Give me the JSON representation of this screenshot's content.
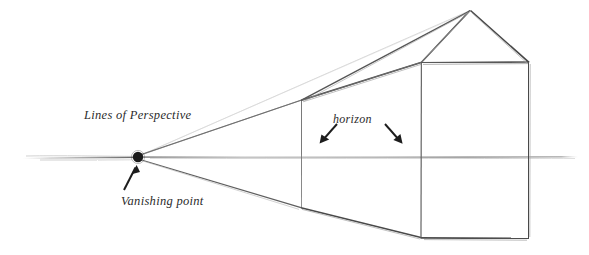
{
  "figure": {
    "medium": "pencil sketch",
    "background_color": "#ffffff",
    "ink_color": "#3a3a3a",
    "faint_ink_color": "#b9b9b9",
    "width": 589,
    "height": 255
  },
  "labels": {
    "lines_of_perspective": "Lines of Perspective",
    "vanishing_point": "Vanishing point",
    "horizon": "horizon"
  },
  "annotations": {
    "vanishing_point_arrow": "arrow-up-right",
    "horizon_arrow_left": "arrow-down-left",
    "horizon_arrow_right": "arrow-down-right"
  },
  "geometry": {
    "vanishing_point": {
      "x": 138,
      "y": 157,
      "radius": 5
    },
    "horizon_line": {
      "y": 157,
      "x_start": 22,
      "x_end": 578
    },
    "box_back_edge": {
      "x": 301,
      "y_top": 100,
      "y_bottom": 208
    },
    "box_front_face": {
      "x_left": 421,
      "x_right": 529,
      "y_top": 62,
      "y_bottom": 238
    },
    "roof_apex": {
      "x": 470,
      "y": 10
    },
    "roof_ridge_back": {
      "x": 302,
      "y": 100
    },
    "gable_left": {
      "x": 421,
      "y": 62
    },
    "gable_right": {
      "x": 529,
      "y": 62
    },
    "perspective_rays": [
      {
        "name": "ray-to-roof-apex",
        "from": [
          138,
          157
        ],
        "to": [
          470,
          10
        ],
        "weight": "faint"
      },
      {
        "name": "ray-to-roof-ridge-back",
        "from": [
          138,
          157
        ],
        "to": [
          302,
          100
        ],
        "weight": "medium"
      },
      {
        "name": "ray-to-box-top-back",
        "from": [
          138,
          157
        ],
        "to": [
          301,
          100
        ],
        "weight": "strong"
      },
      {
        "name": "ray-along-horizon",
        "from": [
          138,
          157
        ],
        "to": [
          578,
          157
        ],
        "weight": "faint"
      },
      {
        "name": "ray-to-box-bottom-back",
        "from": [
          138,
          157
        ],
        "to": [
          301,
          208
        ],
        "weight": "strong"
      }
    ]
  }
}
